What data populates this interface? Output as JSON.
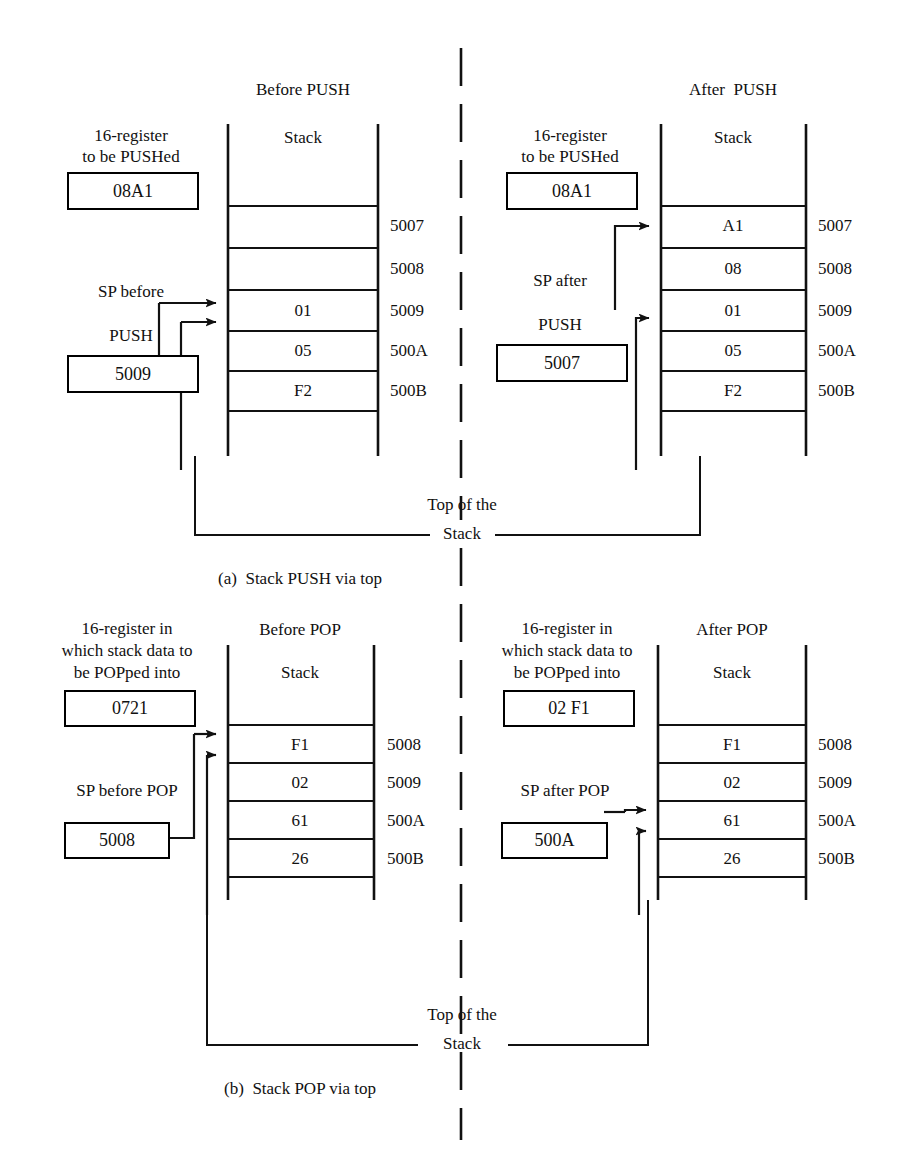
{
  "figure": {
    "caption_a": "(a)  Stack PUSH via top",
    "caption_b": "(b)  Stack POP via top",
    "top_of_stack_line1": "Top of the",
    "top_of_stack_line2": "Stack"
  },
  "push": {
    "before": {
      "title": "Before PUSH",
      "stack_header": "Stack",
      "register_caption_line1": "16-register",
      "register_caption_line2": "to be PUSHed",
      "register_value": "08A1",
      "sp_caption_line1": "SP before",
      "sp_caption_line2": "PUSH",
      "sp_value": "5009",
      "rows": [
        {
          "value": "",
          "address": ""
        },
        {
          "value": "",
          "address": "5007"
        },
        {
          "value": "",
          "address": "5008"
        },
        {
          "value": "01",
          "address": "5009"
        },
        {
          "value": "05",
          "address": "500A"
        },
        {
          "value": "F2",
          "address": "500B"
        }
      ]
    },
    "after": {
      "title": "After  PUSH",
      "stack_header": "Stack",
      "register_caption_line1": "16-register",
      "register_caption_line2": "to be PUSHed",
      "register_value": "08A1",
      "sp_caption_line1": "SP after",
      "sp_caption_line2": "PUSH",
      "sp_value": "5007",
      "rows": [
        {
          "value": "",
          "address": ""
        },
        {
          "value": "A1",
          "address": "5007"
        },
        {
          "value": "08",
          "address": "5008"
        },
        {
          "value": "01",
          "address": "5009"
        },
        {
          "value": "05",
          "address": "500A"
        },
        {
          "value": "F2",
          "address": "500B"
        }
      ]
    }
  },
  "pop": {
    "before": {
      "title": "Before POP",
      "stack_header": "Stack",
      "register_caption_line1": "16-register in",
      "register_caption_line2": "which stack data to",
      "register_caption_line3": "be POPped into",
      "register_value": "0721",
      "sp_caption": "SP before POP",
      "sp_value": "5008",
      "rows": [
        {
          "value": "F1",
          "address": "5008"
        },
        {
          "value": "02",
          "address": "5009"
        },
        {
          "value": "61",
          "address": "500A"
        },
        {
          "value": "26",
          "address": "500B"
        }
      ]
    },
    "after": {
      "title": "After POP",
      "stack_header": "Stack",
      "register_caption_line1": "16-register in",
      "register_caption_line2": "which stack data to",
      "register_caption_line3": "be POPped into",
      "register_value": "02 F1",
      "sp_caption": "SP after POP",
      "sp_value": "500A",
      "rows": [
        {
          "value": "F1",
          "address": "5008"
        },
        {
          "value": "02",
          "address": "5009"
        },
        {
          "value": "61",
          "address": "500A"
        },
        {
          "value": "26",
          "address": "500B"
        }
      ]
    }
  },
  "colors": {
    "ink": "#111111",
    "line": "#222222",
    "background": "#ffffff"
  }
}
